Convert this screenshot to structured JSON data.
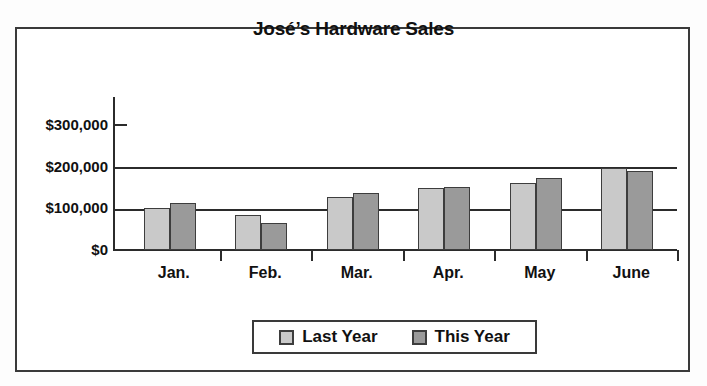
{
  "chart_data": {
    "type": "bar",
    "title": "José’s Hardware Sales",
    "xlabel": "",
    "ylabel": "",
    "categories": [
      "Jan.",
      "Feb.",
      "Mar.",
      "Apr.",
      "May",
      "June"
    ],
    "series": [
      {
        "name": "Last Year",
        "color": "#c9c9c9",
        "values": [
          100000,
          85000,
          127000,
          148000,
          162000,
          198000
        ]
      },
      {
        "name": "This Year",
        "color": "#9a9a9a",
        "values": [
          113000,
          65000,
          138000,
          152000,
          173000,
          190000
        ]
      }
    ],
    "ylim": [
      0,
      300000
    ],
    "ytick_values": [
      0,
      100000,
      200000,
      300000
    ],
    "ytick_labels": [
      "$0",
      "$100,000",
      "$200,000",
      "$300,000"
    ],
    "grid": true,
    "legend_position": "bottom"
  },
  "legend": {
    "entries": [
      {
        "label": "Last Year",
        "swatch": "last-year"
      },
      {
        "label": "This Year",
        "swatch": "this-year"
      }
    ]
  },
  "colors": {
    "last_year": "#c9c9c9",
    "this_year": "#9a9a9a",
    "frame": "#3a3a3a",
    "axis": "#2b2b2b",
    "text": "#111111",
    "background": "#ffffff"
  }
}
